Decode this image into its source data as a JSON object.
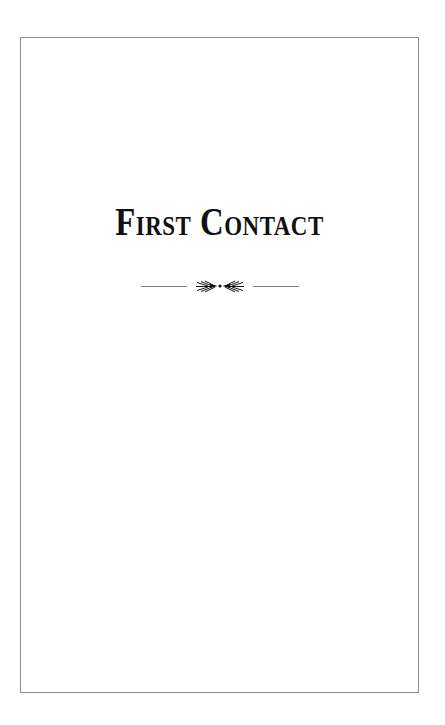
{
  "page": {
    "background_color": "#ffffff",
    "width": 445,
    "height": 725
  },
  "frame": {
    "name": "page-border",
    "color": "#8d8d8d",
    "style": "single thin rule rectangle"
  },
  "chapter": {
    "title": "First Contact",
    "title_style": "small-caps",
    "title_color": "#111111"
  },
  "ornament": {
    "name": "fleuron-divider",
    "glyph_description": "mirrored arrow fleurons flanked by horizontal rules",
    "rule_color": "#7e7e7e",
    "fleuron_color": "#111111"
  }
}
